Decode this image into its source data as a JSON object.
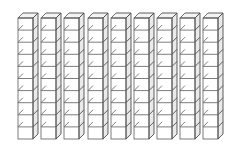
{
  "figure": {
    "background_color": "#ffffff",
    "width": 236,
    "height": 158
  },
  "colors": {
    "outline": "#6e6e6e",
    "outline_dark": "#4d4d4d",
    "front_fill": "#ffffff",
    "top_fill": "#f4f4f4",
    "side_fill": "#eaeaea",
    "background": "#ffffff"
  },
  "geometry": {
    "rod_count": 9,
    "units_per_rod": 10,
    "total_units": 90,
    "first_rod_x": 18,
    "rod_pitch": 23.2,
    "unit_width": 15,
    "unit_height": 12.1,
    "depth_x": 5,
    "depth_y": 5,
    "top_y": 18,
    "stroke_width": 0.9
  },
  "rods": [
    {
      "index": 1,
      "label": "tens-rod-1",
      "value": 10,
      "x": 18
    },
    {
      "index": 2,
      "label": "tens-rod-2",
      "value": 10,
      "x": 41
    },
    {
      "index": 3,
      "label": "tens-rod-3",
      "value": 10,
      "x": 64
    },
    {
      "index": 4,
      "label": "tens-rod-4",
      "value": 10,
      "x": 88
    },
    {
      "index": 5,
      "label": "tens-rod-5",
      "value": 10,
      "x": 111
    },
    {
      "index": 6,
      "label": "tens-rod-6",
      "value": 10,
      "x": 134
    },
    {
      "index": 7,
      "label": "tens-rod-7",
      "value": 10,
      "x": 157
    },
    {
      "index": 8,
      "label": "tens-rod-8",
      "value": 10,
      "x": 180
    },
    {
      "index": 9,
      "label": "tens-rod-9",
      "value": 10,
      "x": 203
    }
  ],
  "caption": ""
}
